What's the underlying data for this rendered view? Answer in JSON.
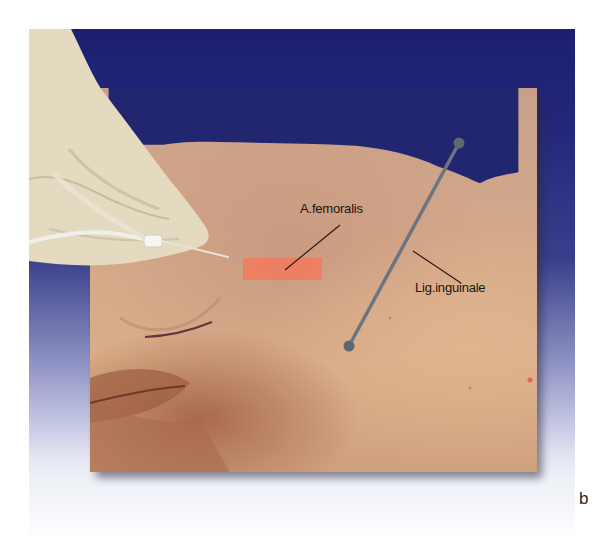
{
  "figure": {
    "panel_letter": "b",
    "colors": {
      "drape_blue": "#1d1f6e",
      "skin": "#d4a98a",
      "glove": "#e6dcc2",
      "ligament_line": "#6b7480",
      "femoral_marker": "#f27a5e",
      "leader_line": "#2a1a14",
      "skin_marking": "#6a3040"
    },
    "annotations": {
      "femoral_artery": {
        "label": "A.femoralis",
        "leader_from": [
          340,
          225
        ],
        "leader_to": [
          285,
          270
        ],
        "marker_rect": {
          "x": 243,
          "y": 258,
          "w": 79,
          "h": 22
        }
      },
      "inguinal_ligament": {
        "label": "Lig.inguinale",
        "line_from": [
          459,
          143
        ],
        "line_to": [
          349,
          346
        ],
        "leader_from": [
          413,
          251
        ],
        "leader_to": [
          461,
          283
        ]
      }
    },
    "objects": {
      "glove_hand": "gloved-hand",
      "catheter": "catheter-with-needle",
      "skin_marking": "curved-pen-marking"
    }
  }
}
